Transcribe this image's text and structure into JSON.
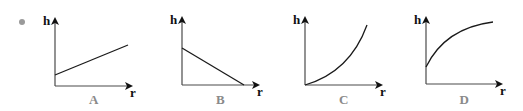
{
  "bullet": "•",
  "colors": {
    "axis": "#4a4a4a",
    "curve": "#1a1a1a",
    "option_label": "#8a8a8a",
    "bullet": "#9a9a9a"
  },
  "graphs": [
    {
      "option": "A",
      "y_label": "h",
      "x_label": "r",
      "shape": "increasing straight line with positive h-intercept",
      "origin": [
        55,
        86
      ],
      "y_top": 17,
      "x_end": 133,
      "curve_path": "M55,75 L128,45"
    },
    {
      "option": "B",
      "y_label": "h",
      "x_label": "r",
      "shape": "decreasing straight line reaching r-axis",
      "origin": [
        182,
        85
      ],
      "y_top": 16,
      "x_end": 260,
      "curve_path": "M182,48 L244,85"
    },
    {
      "option": "C",
      "y_label": "h",
      "x_label": "r",
      "shape": "concave-up curve starting at origin",
      "origin": [
        305,
        85
      ],
      "y_top": 16,
      "x_end": 383,
      "curve_path": "M305,85 Q350,72 367,25"
    },
    {
      "option": "D",
      "y_label": "h",
      "x_label": "r",
      "shape": "concave-down curve with positive h-intercept",
      "origin": [
        426,
        84
      ],
      "y_top": 16,
      "x_end": 503,
      "curve_path": "M426,67 Q445,28 493,22"
    }
  ]
}
